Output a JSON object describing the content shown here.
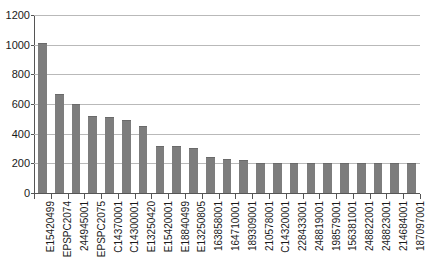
{
  "chart_data": {
    "type": "bar",
    "title": "",
    "subtitle": "",
    "xlabel": "",
    "ylabel": "",
    "ylim": [
      0,
      1200
    ],
    "y_ticks": [
      0,
      200,
      400,
      600,
      800,
      1000,
      1200
    ],
    "grid": "horizontal",
    "legend": "none",
    "bar_color": "#7d7d7d",
    "categories": [
      "E15420499",
      "EPSPC2074",
      "244945001",
      "EPSPC2075",
      "C14370001",
      "C14300001",
      "E13250420",
      "E15420001",
      "E18840499",
      "E13250805",
      "163858001",
      "164710001",
      "189309001",
      "210578001",
      "C14320001",
      "228433001",
      "248819001",
      "198579001",
      "156381001",
      "248822001",
      "248823001",
      "214684001",
      "187097001"
    ],
    "values": [
      1010,
      665,
      600,
      520,
      510,
      495,
      455,
      315,
      315,
      305,
      240,
      230,
      225,
      205,
      205,
      205,
      205,
      205,
      205,
      205,
      205,
      205,
      205
    ]
  },
  "axis": {
    "y_tick_labels": [
      "1200",
      "1000",
      "800",
      "600",
      "400",
      "200",
      "0"
    ]
  }
}
